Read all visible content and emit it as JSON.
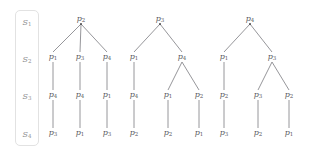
{
  "figure": {
    "background": "#ffffff",
    "node_color": "#59595d",
    "edge_color": "#8a8a8e",
    "stage_label_color": "#8f8f8f",
    "box_border_color": "#e2e2e2"
  },
  "stages": [
    {
      "name": "S",
      "index": "1",
      "y": 24
    },
    {
      "name": "S",
      "index": "2",
      "y": 61
    },
    {
      "name": "S",
      "index": "3",
      "y": 98
    },
    {
      "name": "S",
      "index": "4",
      "y": 136
    }
  ],
  "trees": [
    {
      "id": "tree-1",
      "nodes": [
        {
          "id": "t1-n0",
          "name": "p",
          "index": "2",
          "x": 81,
          "y": 19,
          "stage": 1
        },
        {
          "id": "t1-n1",
          "name": "p",
          "index": "1",
          "x": 53,
          "y": 57,
          "stage": 2
        },
        {
          "id": "t1-n2",
          "name": "p",
          "index": "3",
          "x": 80,
          "y": 57,
          "stage": 2
        },
        {
          "id": "t1-n3",
          "name": "p",
          "index": "4",
          "x": 107,
          "y": 57,
          "stage": 2
        },
        {
          "id": "t1-n4",
          "name": "p",
          "index": "4",
          "x": 53,
          "y": 95,
          "stage": 3
        },
        {
          "id": "t1-n5",
          "name": "p",
          "index": "4",
          "x": 80,
          "y": 95,
          "stage": 3
        },
        {
          "id": "t1-n6",
          "name": "p",
          "index": "1",
          "x": 107,
          "y": 95,
          "stage": 3
        },
        {
          "id": "t1-n7",
          "name": "p",
          "index": "3",
          "x": 53,
          "y": 133,
          "stage": 4
        },
        {
          "id": "t1-n8",
          "name": "p",
          "index": "1",
          "x": 80,
          "y": 133,
          "stage": 4
        },
        {
          "id": "t1-n9",
          "name": "p",
          "index": "3",
          "x": 107,
          "y": 133,
          "stage": 4
        }
      ],
      "edges": [
        [
          "t1-n0",
          "t1-n1"
        ],
        [
          "t1-n0",
          "t1-n2"
        ],
        [
          "t1-n0",
          "t1-n3"
        ],
        [
          "t1-n1",
          "t1-n4"
        ],
        [
          "t1-n2",
          "t1-n5"
        ],
        [
          "t1-n3",
          "t1-n6"
        ],
        [
          "t1-n4",
          "t1-n7"
        ],
        [
          "t1-n5",
          "t1-n8"
        ],
        [
          "t1-n6",
          "t1-n9"
        ]
      ]
    },
    {
      "id": "tree-2",
      "nodes": [
        {
          "id": "t2-n0",
          "name": "p",
          "index": "3",
          "x": 160,
          "y": 19,
          "stage": 1
        },
        {
          "id": "t2-n1",
          "name": "p",
          "index": "1",
          "x": 134,
          "y": 57,
          "stage": 2
        },
        {
          "id": "t2-n2",
          "name": "p",
          "index": "4",
          "x": 182,
          "y": 57,
          "stage": 2
        },
        {
          "id": "t2-n3",
          "name": "p",
          "index": "4",
          "x": 134,
          "y": 95,
          "stage": 3
        },
        {
          "id": "t2-n4",
          "name": "p",
          "index": "1",
          "x": 168,
          "y": 95,
          "stage": 3
        },
        {
          "id": "t2-n5",
          "name": "p",
          "index": "2",
          "x": 199,
          "y": 95,
          "stage": 3
        },
        {
          "id": "t2-n6",
          "name": "p",
          "index": "2",
          "x": 134,
          "y": 133,
          "stage": 4
        },
        {
          "id": "t2-n7",
          "name": "p",
          "index": "2",
          "x": 168,
          "y": 133,
          "stage": 4
        },
        {
          "id": "t2-n8",
          "name": "p",
          "index": "1",
          "x": 199,
          "y": 133,
          "stage": 4
        }
      ],
      "edges": [
        [
          "t2-n0",
          "t2-n1"
        ],
        [
          "t2-n0",
          "t2-n2"
        ],
        [
          "t2-n1",
          "t2-n3"
        ],
        [
          "t2-n2",
          "t2-n4"
        ],
        [
          "t2-n2",
          "t2-n5"
        ],
        [
          "t2-n3",
          "t2-n6"
        ],
        [
          "t2-n4",
          "t2-n7"
        ],
        [
          "t2-n5",
          "t2-n8"
        ]
      ]
    },
    {
      "id": "tree-3",
      "nodes": [
        {
          "id": "t3-n0",
          "name": "p",
          "index": "4",
          "x": 250,
          "y": 19,
          "stage": 1
        },
        {
          "id": "t3-n1",
          "name": "p",
          "index": "1",
          "x": 224,
          "y": 57,
          "stage": 2
        },
        {
          "id": "t3-n2",
          "name": "p",
          "index": "3",
          "x": 272,
          "y": 57,
          "stage": 2
        },
        {
          "id": "t3-n3",
          "name": "p",
          "index": "2",
          "x": 224,
          "y": 95,
          "stage": 3
        },
        {
          "id": "t3-n4",
          "name": "p",
          "index": "3",
          "x": 258,
          "y": 95,
          "stage": 3
        },
        {
          "id": "t3-n5",
          "name": "p",
          "index": "2",
          "x": 289,
          "y": 95,
          "stage": 3
        },
        {
          "id": "t3-n6",
          "name": "p",
          "index": "3",
          "x": 224,
          "y": 133,
          "stage": 4
        },
        {
          "id": "t3-n7",
          "name": "p",
          "index": "2",
          "x": 258,
          "y": 133,
          "stage": 4
        },
        {
          "id": "t3-n8",
          "name": "p",
          "index": "1",
          "x": 289,
          "y": 133,
          "stage": 4
        }
      ],
      "edges": [
        [
          "t3-n0",
          "t3-n1"
        ],
        [
          "t3-n0",
          "t3-n2"
        ],
        [
          "t3-n1",
          "t3-n3"
        ],
        [
          "t3-n2",
          "t3-n4"
        ],
        [
          "t3-n2",
          "t3-n5"
        ],
        [
          "t3-n3",
          "t3-n6"
        ],
        [
          "t3-n4",
          "t3-n7"
        ],
        [
          "t3-n5",
          "t3-n8"
        ]
      ]
    }
  ]
}
